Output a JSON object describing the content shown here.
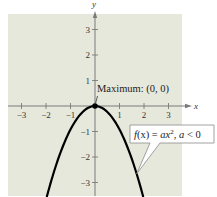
{
  "chart_data": {
    "type": "line",
    "title": "",
    "xlabel": "x",
    "ylabel": "y",
    "xlim": [
      -3.55,
      3.55
    ],
    "ylim": [
      -3.5,
      3.7
    ],
    "grid": false,
    "x_ticks": [
      -3,
      -2,
      -1,
      1,
      2,
      3
    ],
    "x_tick_labels": [
      "−3",
      "−2",
      "−1",
      "1",
      "2",
      "3"
    ],
    "y_ticks": [
      3,
      2,
      1,
      -1,
      -2,
      -3
    ],
    "y_tick_labels": [
      "3",
      "2",
      "1",
      "−1",
      "−2",
      "−3"
    ],
    "series": [
      {
        "name": "f(x) = ax², a < 0",
        "function": "a*x^2",
        "a": -0.92,
        "x_range": [
          -1.97,
          1.97
        ],
        "color": "#000000"
      }
    ],
    "points": [
      {
        "name": "maximum",
        "x": 0,
        "y": 0,
        "label": "Maximum: (0, 0)"
      }
    ],
    "annotations": [
      {
        "name": "maximum-label",
        "text": "Maximum: (0, 0)"
      },
      {
        "name": "function-callout",
        "text_parts": [
          "f",
          "(x) = ",
          "ax",
          "2",
          ", ",
          "a",
          " < 0"
        ],
        "points_to_x": 1.7
      }
    ],
    "colors": {
      "plot_background": "#e6e8dc",
      "axis": "#7a7a7a",
      "curve": "#000000",
      "callout_fill": "#ffffff",
      "callout_border": "#8a8a8a"
    }
  }
}
